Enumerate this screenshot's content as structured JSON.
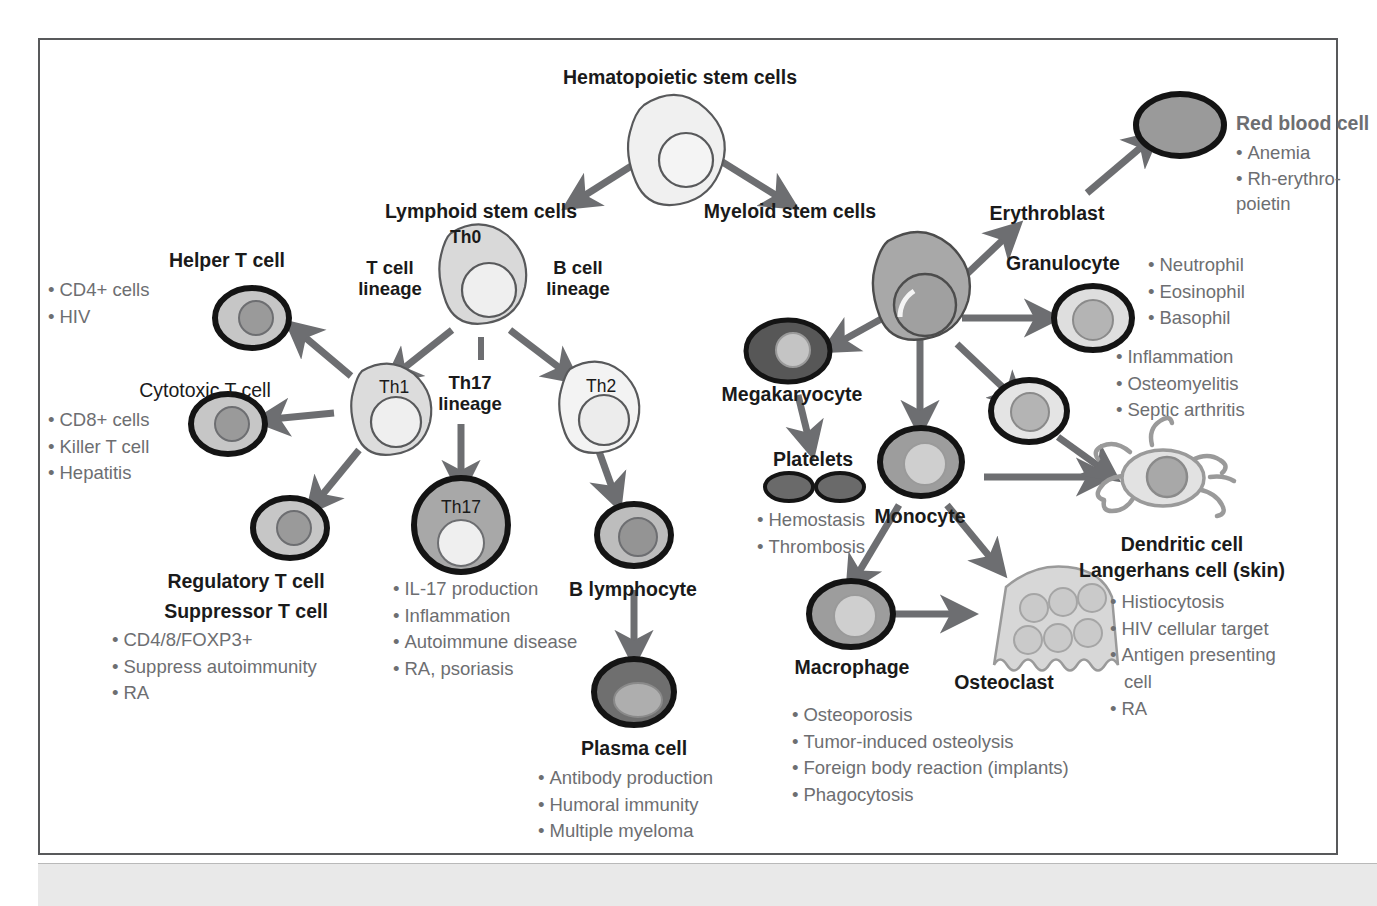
{
  "figure": {
    "title": "Hematopoietic stem cells",
    "type": "hematopoiesis lineage diagram"
  },
  "nodes": {
    "hsc": {
      "label": "Hematopoietic stem cells"
    },
    "lymphoid": {
      "label": "Lymphoid stem cells",
      "cell_text": "Th0"
    },
    "myeloid": {
      "label": "Myeloid stem cells"
    },
    "t_lineage": {
      "line1": "T cell",
      "line2": "lineage"
    },
    "b_lineage": {
      "line1": "B cell",
      "line2": "lineage"
    },
    "th17_lineage": {
      "line1": "Th17",
      "line2": "lineage"
    },
    "th1": {
      "cell_text": "Th1"
    },
    "th2": {
      "cell_text": "Th2"
    },
    "th17": {
      "cell_text": "Th17"
    },
    "helper_t": {
      "label": "Helper T cell",
      "bullets": [
        "CD4+ cells",
        "HIV"
      ]
    },
    "cytotoxic_t": {
      "label": "Cytotoxic T cell",
      "bullets": [
        "CD8+ cells",
        "Killer T cell",
        "Hepatitis"
      ]
    },
    "regulatory_t": {
      "label_line1": "Regulatory T cell",
      "label_line2": "Suppressor T cell",
      "bullets": [
        "CD4/8/FOXP3+",
        "Suppress autoimmunity",
        "RA"
      ]
    },
    "th17_cell": {
      "bullets": [
        "IL-17 production",
        "Inflammation",
        "Autoimmune disease",
        "RA, psoriasis"
      ]
    },
    "b_lymphocyte": {
      "label": "B lymphocyte"
    },
    "plasma_cell": {
      "label": "Plasma cell",
      "bullets": [
        "Antibody production",
        "Humoral immunity",
        "Multiple myeloma"
      ]
    },
    "erythroblast": {
      "label": "Erythroblast"
    },
    "red_blood_cell": {
      "label": "Red blood cell",
      "bullets": [
        "Anemia",
        "Rh-erythro-",
        "poietin"
      ]
    },
    "granulocyte": {
      "label": "Granulocyte",
      "types": [
        "Neutrophil",
        "Eosinophil",
        "Basophil"
      ],
      "bullets": [
        "Inflammation",
        "Osteomyelitis",
        "Septic arthritis"
      ]
    },
    "megakaryocyte": {
      "label": "Megakaryocyte"
    },
    "platelets": {
      "label": "Platelets",
      "bullets": [
        "Hemostasis",
        "Thrombosis"
      ]
    },
    "monocyte": {
      "label": "Monocyte"
    },
    "macrophage": {
      "label": "Macrophage"
    },
    "osteoclast": {
      "label": "Osteoclast",
      "bullets": [
        "Osteoporosis",
        "Tumor-induced osteolysis",
        "Foreign body reaction (implants)",
        "Phagocytosis"
      ]
    },
    "dendritic": {
      "label_line1": "Dendritic cell",
      "label_line2": "Langerhans cell (skin)",
      "bullets": [
        "Histiocytosis",
        "HIV cellular target",
        "Antigen presenting",
        "cell",
        "RA"
      ]
    }
  },
  "colors": {
    "frame_border": "#58595b",
    "arrow": "#6d6e71",
    "text_black": "#1a1a1a",
    "text_gray": "#6d6e71",
    "cell_very_light": "#f0f0f0",
    "cell_light": "#dcdcdc",
    "cell_mid": "#b8b8b8",
    "cell_dark": "#8a8a8a",
    "cell_darker": "#6b6b6b",
    "background": "#ffffff",
    "bottom_band": "#e9e9e9"
  }
}
